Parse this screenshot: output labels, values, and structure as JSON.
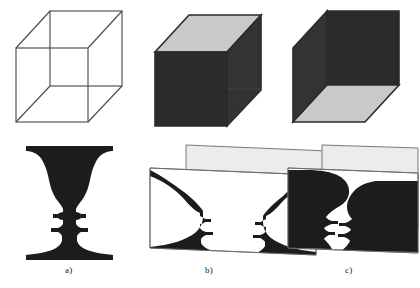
{
  "figure": {
    "background_color": "#ffffff",
    "panels": [
      {
        "id": "a",
        "caption": "a)",
        "caption_x": 65,
        "caption_y": 266,
        "top_figure": "necker-cube-wireframe",
        "bottom_figure": "rubin-vase-silhouette",
        "description": "Ambiguous figures: wireframe Necker cube and Rubin vase/faces silhouette"
      },
      {
        "id": "b",
        "caption": "b)",
        "caption_x": 205,
        "caption_y": 266,
        "top_figure": "necker-cube-shaded-top-lit",
        "bottom_figure": "rubin-vase-on-planes",
        "description": "First depth interpretation: cube seen from above, vase in front of background plane"
      },
      {
        "id": "c",
        "caption": "c)",
        "caption_x": 345,
        "caption_y": 266,
        "top_figure": "necker-cube-shaded-bottom-lit",
        "bottom_figure": "faces-on-planes",
        "description": "Second depth interpretation: cube seen from below, two facing profiles in front of background plane"
      }
    ]
  },
  "colors": {
    "line": "#4d4d4d",
    "line_dark": "#3a3a3a",
    "face_light": "#c9c9c9",
    "face_light_alt": "#d0d0d0",
    "face_dark": "#2b2b2b",
    "face_dark_alt": "#333333",
    "silhouette": "#1c1c1c",
    "plane_back": "#e9e9e9",
    "plane_front": "#ffffff",
    "caption_text": "#1a1a1a"
  },
  "geometry": {
    "cube_a": {
      "front": [
        [
          16,
          48
        ],
        [
          88,
          48
        ],
        [
          88,
          122
        ],
        [
          16,
          122
        ]
      ],
      "back": [
        [
          50,
          11
        ],
        [
          122,
          11
        ],
        [
          122,
          86
        ],
        [
          50,
          86
        ]
      ]
    },
    "cube_b": {
      "front": [
        [
          155,
          52
        ],
        [
          227,
          52
        ],
        [
          227,
          126
        ],
        [
          155,
          126
        ]
      ],
      "back": [
        [
          189,
          15
        ],
        [
          261,
          15
        ],
        [
          261,
          90
        ],
        [
          189,
          90
        ]
      ],
      "top_face_fill": "#c9c9c9",
      "front_face_fill": "#2b2b2b",
      "right_face_fill": "#333333"
    },
    "cube_c": {
      "front": [
        [
          293,
          48
        ],
        [
          365,
          48
        ],
        [
          365,
          122
        ],
        [
          293,
          122
        ]
      ],
      "back": [
        [
          327,
          85
        ],
        [
          399,
          85
        ],
        [
          399,
          11
        ],
        [
          327,
          11
        ]
      ],
      "bottom_face_fill": "#c9c9c9",
      "left_face_fill": "#333333",
      "back_face_fill": "#2b2b2b"
    },
    "plane_b_back": [
      [
        186,
        145
      ],
      [
        352,
        152
      ],
      [
        352,
        232
      ],
      [
        186,
        225
      ]
    ],
    "plane_b_front": [
      [
        150,
        168
      ],
      [
        316,
        175
      ],
      [
        316,
        255
      ],
      [
        150,
        248
      ]
    ],
    "plane_c_back": [
      [
        322,
        145
      ],
      [
        412,
        148
      ],
      [
        412,
        228
      ],
      [
        322,
        225
      ]
    ],
    "plane_c_front": [
      [
        288,
        168
      ],
      [
        412,
        172
      ],
      [
        412,
        252
      ],
      [
        288,
        248
      ]
    ]
  }
}
